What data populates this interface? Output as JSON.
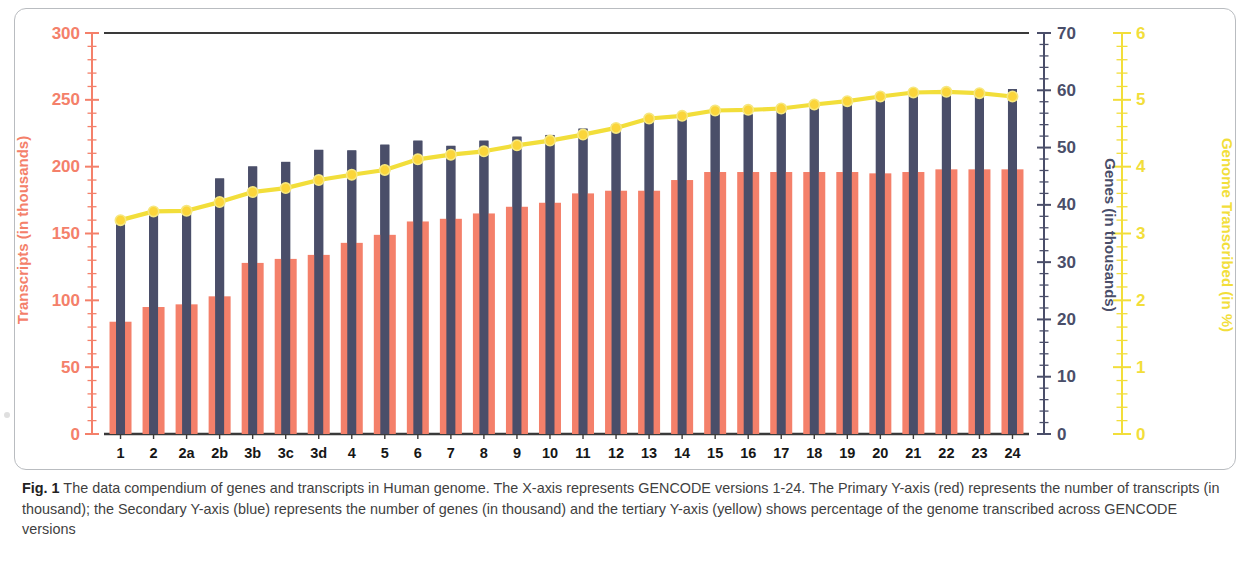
{
  "figure": {
    "label": "Fig. 1",
    "caption": "The data compendium of genes and transcripts in Human genome. The X-axis represents GENCODE versions 1-24. The Primary Y-axis (red) represents the number of transcripts (in thousand); the Secondary Y-axis (blue) represents the number of genes (in thousand) and the tertiary Y-axis (yellow) shows percentage of the genome transcribed across GENCODE versions"
  },
  "colors": {
    "transcripts_red": "#F4806A",
    "genes_blue": "#4A4E69",
    "genome_yellow": "#F2DE3A",
    "frame_gray": "#B9BCC0",
    "axis_dark": "#3A3A3A"
  },
  "chart_data": {
    "type": "bar",
    "title": "",
    "xlabel": "",
    "grid": false,
    "legend": "none",
    "categories": [
      "1",
      "2",
      "2a",
      "2b",
      "3b",
      "3c",
      "3d",
      "4",
      "5",
      "6",
      "7",
      "8",
      "9",
      "10",
      "11",
      "12",
      "13",
      "14",
      "15",
      "16",
      "17",
      "18",
      "19",
      "20",
      "21",
      "22",
      "23",
      "24"
    ],
    "axes": {
      "primary": {
        "name": "Transcripts (in thousands)",
        "color": "#F4806A",
        "ylim": [
          0,
          300
        ],
        "ticks": [
          0,
          50,
          100,
          150,
          200,
          250,
          300
        ]
      },
      "secondary": {
        "name": "Genes (in thousands)",
        "color": "#4A4E69",
        "ylim": [
          0,
          70
        ],
        "ticks": [
          0,
          10,
          20,
          30,
          40,
          50,
          60,
          70
        ]
      },
      "tertiary": {
        "name": "Genome Transcribed (in %)",
        "color": "#F2DE3A",
        "ylim": [
          0,
          6
        ],
        "ticks": [
          0,
          1,
          2,
          3,
          4,
          5,
          6
        ]
      }
    },
    "series": [
      {
        "name": "Transcripts (in thousands)",
        "axis": "primary",
        "color": "#F4806A",
        "kind": "bar",
        "values": [
          84,
          95,
          97,
          103,
          128,
          131,
          134,
          143,
          149,
          159,
          161,
          165,
          170,
          173,
          180,
          182,
          182,
          190,
          196,
          196,
          196,
          196,
          196,
          195,
          196,
          198,
          198,
          198
        ]
      },
      {
        "name": "Genes (in thousands)",
        "axis": "secondary",
        "color": "#4A4E69",
        "kind": "bar",
        "values": [
          36.6,
          38.5,
          38.7,
          44.6,
          46.7,
          47.5,
          49.6,
          49.5,
          50.5,
          51.2,
          50.3,
          51.2,
          51.9,
          52.2,
          53.3,
          54.0,
          55.0,
          55.2,
          56.0,
          55.8,
          57.0,
          57.3,
          58.0,
          58.4,
          59.9,
          60.0,
          60.0,
          60.2
        ]
      },
      {
        "name": "Genome Transcribed (in %)",
        "axis": "tertiary",
        "color": "#F2DE3A",
        "kind": "line",
        "values": [
          3.2,
          3.33,
          3.34,
          3.47,
          3.62,
          3.68,
          3.8,
          3.88,
          3.95,
          4.11,
          4.18,
          4.23,
          4.32,
          4.39,
          4.48,
          4.58,
          4.72,
          4.76,
          4.84,
          4.85,
          4.87,
          4.93,
          4.98,
          5.05,
          5.11,
          5.12,
          5.1,
          5.05
        ]
      }
    ]
  }
}
